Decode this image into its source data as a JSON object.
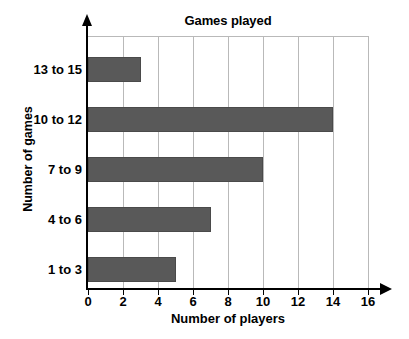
{
  "chart_data": {
    "type": "bar",
    "orientation": "horizontal",
    "title": "Games played",
    "xlabel": "Number of players",
    "ylabel": "Number of games",
    "categories": [
      "1 to 3",
      "4 to 6",
      "7 to 9",
      "10 to 12",
      "13 to 15"
    ],
    "values": [
      5,
      7,
      10,
      14,
      3
    ],
    "xlim": [
      0,
      16
    ],
    "xticks": [
      0,
      2,
      4,
      6,
      8,
      10,
      12,
      14,
      16
    ],
    "xtick_labels": [
      "0",
      "2",
      "4",
      "6",
      "8",
      "10",
      "12",
      "14",
      "16"
    ],
    "grid": "vertical",
    "legend": null,
    "bar_color": "#595959",
    "grid_color": "#b9b9b9",
    "axis_color": "#000000",
    "background_color": "#ffffff",
    "series": [
      {
        "name": "Number of players",
        "points": [
          {
            "category": "13 to 15",
            "value": 3
          },
          {
            "category": "10 to 12",
            "value": 14
          },
          {
            "category": "7 to 9",
            "value": 10
          },
          {
            "category": "4 to 6",
            "value": 7
          },
          {
            "category": "1 to 3",
            "value": 5
          }
        ]
      }
    ]
  }
}
